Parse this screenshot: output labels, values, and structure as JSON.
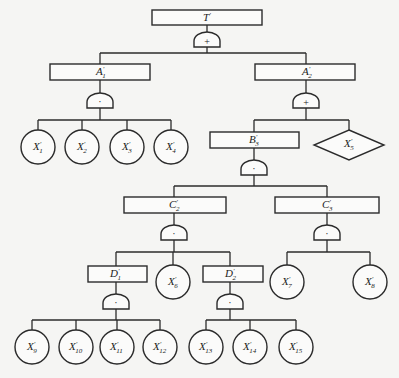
{
  "diagram": {
    "type": "fault-tree",
    "top_event": {
      "id": "T",
      "base": "T",
      "sub": "",
      "gate": "OR",
      "gate_symbol": "+"
    },
    "events": [
      {
        "id": "A1",
        "base": "A",
        "sub": "1",
        "gate": "AND",
        "gate_symbol": "·",
        "children": [
          "X1",
          "X2",
          "X3",
          "X4"
        ]
      },
      {
        "id": "A2",
        "base": "A",
        "sub": "2",
        "gate": "OR",
        "gate_symbol": "+",
        "children": [
          "B3",
          "X5"
        ]
      },
      {
        "id": "B3",
        "base": "B",
        "sub": "3",
        "gate": "AND",
        "gate_symbol": "·",
        "children": [
          "C2",
          "C3"
        ]
      },
      {
        "id": "C2",
        "base": "C",
        "sub": "2",
        "gate": "AND",
        "gate_symbol": "·",
        "children": [
          "D1",
          "X6",
          "D2"
        ]
      },
      {
        "id": "C3",
        "base": "C",
        "sub": "3",
        "gate": "AND",
        "gate_symbol": "·",
        "children": [
          "X7",
          "X8"
        ]
      },
      {
        "id": "D1",
        "base": "D",
        "sub": "1",
        "gate": "AND",
        "gate_symbol": "·",
        "children": [
          "X9",
          "X10",
          "X11",
          "X12"
        ]
      },
      {
        "id": "D2",
        "base": "D",
        "sub": "2",
        "gate": "AND",
        "gate_symbol": "·",
        "children": [
          "X13",
          "X14",
          "X15"
        ]
      }
    ],
    "basic_events": [
      {
        "id": "X1",
        "base": "X",
        "sub": "1"
      },
      {
        "id": "X2",
        "base": "X",
        "sub": "2"
      },
      {
        "id": "X3",
        "base": "X",
        "sub": "3"
      },
      {
        "id": "X4",
        "base": "X",
        "sub": "4"
      },
      {
        "id": "X6",
        "base": "X",
        "sub": "6"
      },
      {
        "id": "X7",
        "base": "X",
        "sub": "7"
      },
      {
        "id": "X8",
        "base": "X",
        "sub": "8"
      },
      {
        "id": "X9",
        "base": "X",
        "sub": "9"
      },
      {
        "id": "X10",
        "base": "X",
        "sub": "10"
      },
      {
        "id": "X11",
        "base": "X",
        "sub": "11"
      },
      {
        "id": "X12",
        "base": "X",
        "sub": "12"
      },
      {
        "id": "X13",
        "base": "X",
        "sub": "13"
      },
      {
        "id": "X14",
        "base": "X",
        "sub": "14"
      },
      {
        "id": "X15",
        "base": "X",
        "sub": "15"
      }
    ],
    "undeveloped_events": [
      {
        "id": "X5",
        "base": "X",
        "sub": "5",
        "shape": "diamond"
      }
    ],
    "prime": "′",
    "line_color": "#2b2b2b",
    "background_color": "#f5f5f3"
  }
}
